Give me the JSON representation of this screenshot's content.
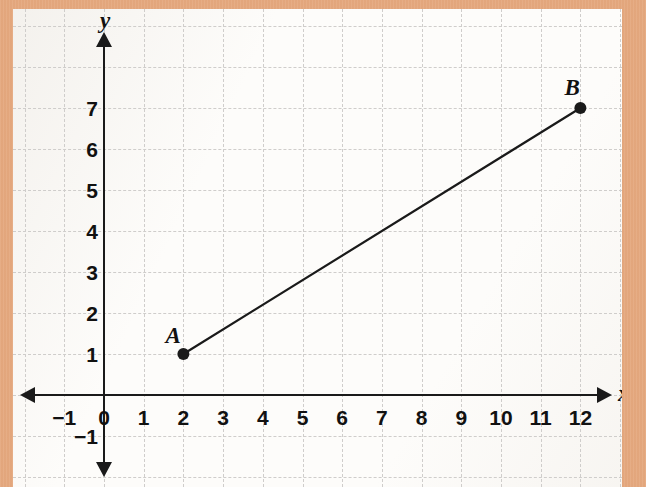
{
  "figure": {
    "border_color": "#e5a97f",
    "paper_color": "#fdfcfa",
    "grid_color": "#cfcdcb",
    "axis_color": "#1a1a1a"
  },
  "axes": {
    "x_axis_name": "x",
    "y_axis_name": "y",
    "x_ticks": [
      "−1",
      "0",
      "1",
      "2",
      "3",
      "4",
      "5",
      "6",
      "7",
      "8",
      "9",
      "10",
      "11",
      "12"
    ],
    "y_ticks": [
      "7",
      "6",
      "5",
      "4",
      "3",
      "2",
      "1",
      "−1"
    ],
    "x_min": -1,
    "x_max": 12,
    "y_min": -1,
    "y_max": 8,
    "grid": "dashed",
    "arrows": "both-ends"
  },
  "chart_data": {
    "type": "scatter",
    "xlabel": "x",
    "ylabel": "y",
    "xlim": [
      -1,
      12
    ],
    "ylim": [
      -1,
      8
    ],
    "grid": true,
    "legend": "none",
    "points": [
      {
        "label": "A",
        "x": 2,
        "y": 1
      },
      {
        "label": "B",
        "x": 12,
        "y": 7
      }
    ],
    "segments": [
      {
        "from": "A",
        "to": "B",
        "x1": 2,
        "y1": 1,
        "x2": 12,
        "y2": 7
      }
    ],
    "categories": [
      "A",
      "B"
    ],
    "x": [
      2,
      12
    ],
    "values": [
      1,
      7
    ]
  }
}
